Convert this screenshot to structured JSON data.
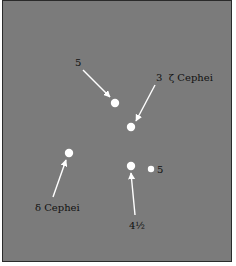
{
  "diagram": {
    "type": "star-chart",
    "background_color": "#7b7b7b",
    "star_color": "#ffffff",
    "stars": [
      {
        "id": "star-mag5-upper",
        "x": 115,
        "y": 103,
        "r": 4
      },
      {
        "id": "star-zeta-cephei",
        "x": 131,
        "y": 127,
        "r": 4
      },
      {
        "id": "star-delta-cephei",
        "x": 69,
        "y": 153,
        "r": 4
      },
      {
        "id": "star-mag4-5",
        "x": 131,
        "y": 166,
        "r": 4
      },
      {
        "id": "star-mag5-right",
        "x": 151,
        "y": 169,
        "r": 3
      }
    ],
    "labels": {
      "mag5_upper": "5",
      "zeta_cephei": "3  ζ Cephei",
      "delta_cephei": "δ Cephei",
      "mag4_5": "4½",
      "mag5_right": "5"
    }
  }
}
